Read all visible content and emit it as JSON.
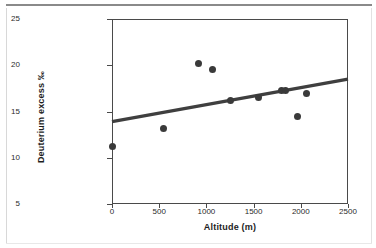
{
  "chart_data": {
    "type": "scatter",
    "title": "",
    "xlabel": "Altitude (m)",
    "ylabel": "Deuterium excess ‰",
    "xlim": [
      0,
      2500
    ],
    "ylim": [
      5,
      25
    ],
    "xticks": [
      "0",
      "500",
      "1000",
      "1500",
      "2000",
      "2500"
    ],
    "xtick_values": [
      0,
      500,
      1000,
      1500,
      2000,
      2500
    ],
    "yticks": [
      "5",
      "10",
      "15",
      "20",
      "25"
    ],
    "ytick_values": [
      5,
      10,
      15,
      20,
      25
    ],
    "grid": false,
    "legend": null,
    "marker_color": "#3a3a3a",
    "line_color": "#3f3f3f",
    "series": [
      {
        "name": "Deuterium excess vs altitude",
        "x": [
          0,
          550,
          920,
          1060,
          1260,
          1550,
          1800,
          1840,
          1960,
          2060
        ],
        "y": [
          11.2,
          13.2,
          20.2,
          19.5,
          16.2,
          16.5,
          17.3,
          17.3,
          14.5,
          17.0
        ]
      }
    ],
    "trendline": {
      "name": "linear regression",
      "x": [
        0,
        2500
      ],
      "y": [
        13.9,
        18.5
      ]
    }
  },
  "figure": {
    "axis_color": "#4a4a4a"
  }
}
